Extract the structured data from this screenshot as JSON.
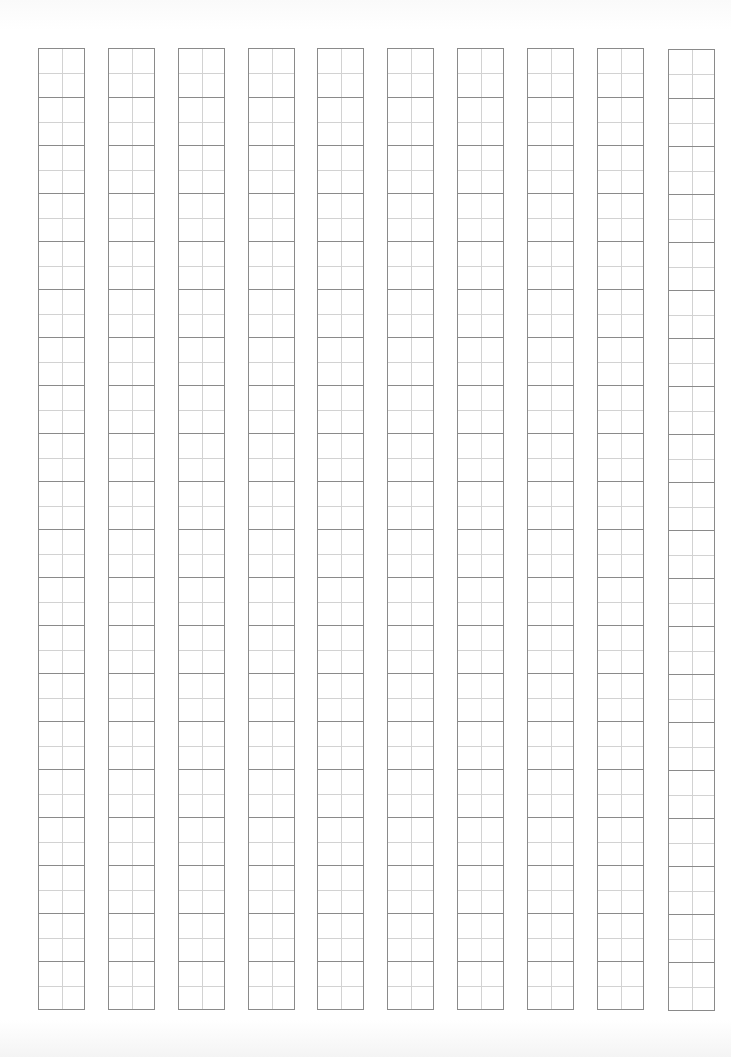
{
  "sheet": {
    "type": "tian-zi-ge practice grid",
    "columns": 10,
    "cells_per_column": 20,
    "cell_height_px": 48,
    "column_width_px": 47,
    "column_left_positions": [
      38,
      108,
      178,
      248,
      317,
      387,
      457,
      527,
      597,
      668
    ],
    "column_top_positions": [
      48,
      48,
      48,
      48,
      48,
      48,
      48,
      48,
      48,
      49
    ],
    "colors": {
      "background": "#ffffff",
      "outer_line": "#8a8a8a",
      "guide_line": "#d2d2d2"
    }
  }
}
